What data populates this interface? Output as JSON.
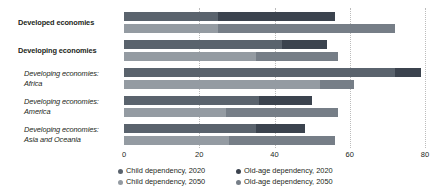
{
  "chart_data": {
    "type": "bar",
    "orientation": "horizontal",
    "stacked": true,
    "title": "",
    "xlabel": "",
    "ylabel": "",
    "xlim": [
      0,
      80
    ],
    "xticks": [
      0,
      20,
      40,
      60,
      80
    ],
    "xtick_labels": [
      "0",
      "20",
      "40",
      "60",
      "80"
    ],
    "grid": true,
    "grid_axis": "x",
    "legend_position": "bottom",
    "categories": [
      "Developed economies",
      "Developing economies",
      "Developing economies:\nAfrica",
      "Developing economies:\nAmerica",
      "Developing economies:\nAsia and Oceania"
    ],
    "category_styles": [
      "bold",
      "bold",
      "italic",
      "italic",
      "italic"
    ],
    "series": [
      {
        "name": "Child dependency, 2020",
        "color": "#5a636d",
        "year": "2020",
        "component": "child",
        "values": [
          25,
          42,
          72,
          36,
          35
        ]
      },
      {
        "name": "Old-age dependency, 2020",
        "color": "#3b434e",
        "year": "2020",
        "component": "old-age",
        "values": [
          31,
          12,
          7,
          14,
          13
        ]
      },
      {
        "name": "Child dependency, 2050",
        "color": "#949ba2",
        "year": "2050",
        "component": "child",
        "values": [
          25,
          35,
          52,
          27,
          28
        ]
      },
      {
        "name": "Old-age dependency, 2050",
        "color": "#767e87",
        "year": "2050",
        "component": "old-age",
        "values": [
          47,
          22,
          9,
          30,
          28
        ]
      }
    ],
    "totals_2020": [
      56,
      54,
      79,
      50,
      48
    ],
    "totals_2050": [
      72,
      57,
      61,
      57,
      56
    ]
  },
  "legend": {
    "items": [
      {
        "label": "Child dependency, 2020",
        "color": "#5a636d"
      },
      {
        "label": "Child dependency, 2050",
        "color": "#949ba2"
      },
      {
        "label": "Old-age dependency, 2020",
        "color": "#3b434e"
      },
      {
        "label": "Old-age dependency, 2050",
        "color": "#767e87"
      }
    ]
  }
}
